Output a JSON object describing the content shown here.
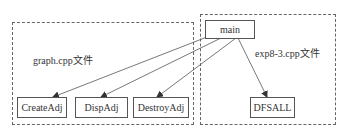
{
  "groups": {
    "graph_file": {
      "label": "graph.cpp文件"
    },
    "exp_file": {
      "label": "exp8-3.cpp文件"
    }
  },
  "nodes": {
    "main": "main",
    "create_adj": "CreateAdj",
    "disp_adj": "DispAdj",
    "destroy_adj": "DestroyAdj",
    "dfsall": "DFSALL"
  },
  "edges": [
    {
      "from": "main",
      "to": "CreateAdj"
    },
    {
      "from": "main",
      "to": "DispAdj"
    },
    {
      "from": "main",
      "to": "DestroyAdj"
    },
    {
      "from": "main",
      "to": "DFSALL"
    }
  ],
  "colors": {
    "line": "#555555",
    "dashed_border": "#666666",
    "text": "#333333"
  }
}
